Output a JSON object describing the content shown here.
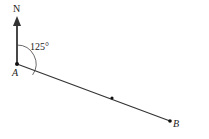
{
  "diagram": {
    "north_label": "N",
    "angle_label": "125°",
    "point_a_label": "A",
    "point_b_label": "B",
    "angle_degrees": 125,
    "colors": {
      "stroke": "#222222",
      "background": "#ffffff"
    }
  }
}
